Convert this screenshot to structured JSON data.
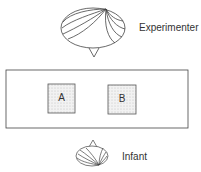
{
  "diagram": {
    "experimenter": {
      "label": "Experimenter"
    },
    "infant": {
      "label": "Infant"
    },
    "table": {
      "locations": [
        {
          "label": "A"
        },
        {
          "label": "B"
        }
      ]
    }
  },
  "colors": {
    "stroke": "#444444",
    "box_fill": "#e8e8e8",
    "text": "#333333"
  }
}
